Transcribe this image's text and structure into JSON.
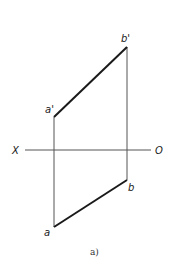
{
  "diagram": {
    "type": "orthographic-projection-of-line-segment",
    "caption": "a)",
    "axis": {
      "left_label": "X",
      "right_label": "O"
    },
    "points": {
      "a_prime": {
        "label": "a'",
        "x": 54,
        "y": 117
      },
      "b_prime": {
        "label": "b'",
        "x": 127,
        "y": 47
      },
      "a": {
        "label": "a",
        "x": 54,
        "y": 227
      },
      "b": {
        "label": "b",
        "x": 127,
        "y": 180
      }
    },
    "colors": {
      "line": "#1a1a1a",
      "projector": "#555555"
    }
  }
}
